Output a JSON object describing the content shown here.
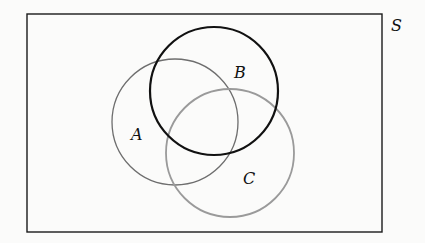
{
  "diagram": {
    "type": "venn",
    "universe": {
      "label": "S",
      "x": 27,
      "y": 14,
      "width": 355,
      "height": 218,
      "stroke": "#1a1a1a"
    },
    "sets": [
      {
        "label": "A",
        "cx": 175,
        "cy": 122,
        "r": 63,
        "stroke": "#6e6e6e",
        "stroke_width": 1.3,
        "label_x": 133,
        "label_y": 139
      },
      {
        "label": "B",
        "cx": 214,
        "cy": 91,
        "r": 64,
        "stroke": "#111111",
        "stroke_width": 2.2,
        "label_x": 234,
        "label_y": 78
      },
      {
        "label": "C",
        "cx": 230,
        "cy": 153,
        "r": 64,
        "stroke": "#9a9a9a",
        "stroke_width": 1.8,
        "label_x": 243,
        "label_y": 183
      }
    ]
  }
}
